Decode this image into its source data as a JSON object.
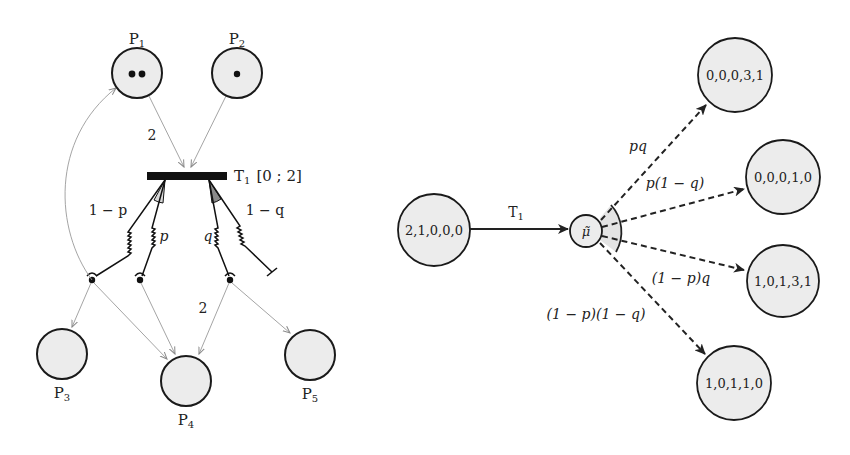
{
  "left_net": {
    "places": [
      {
        "id": "P1",
        "label": "P",
        "sub": "1",
        "cx": 137,
        "cy": 73,
        "r": 25,
        "tokens": 2,
        "label_x": 137,
        "label_y": 40
      },
      {
        "id": "P2",
        "label": "P",
        "sub": "2",
        "cx": 237,
        "cy": 73,
        "r": 25,
        "tokens": 1,
        "label_x": 237,
        "label_y": 40
      },
      {
        "id": "P3",
        "label": "P",
        "sub": "3",
        "cx": 62,
        "cy": 354,
        "r": 25,
        "tokens": 0,
        "label_x": 62,
        "label_y": 398
      },
      {
        "id": "P4",
        "label": "P",
        "sub": "4",
        "cx": 186,
        "cy": 381,
        "r": 25,
        "tokens": 0,
        "label_x": 186,
        "label_y": 425
      },
      {
        "id": "P5",
        "label": "P",
        "sub": "5",
        "cx": 310,
        "cy": 355,
        "r": 25,
        "tokens": 0,
        "label_x": 310,
        "label_y": 399
      }
    ],
    "transition": {
      "label": "T",
      "sub": "1",
      "interval": "[0 ; 2]",
      "x": 147,
      "y": 172,
      "w": 80,
      "h": 8
    },
    "input_weight": "2",
    "output_weight": "2",
    "branches": [
      {
        "label": "1 − p",
        "kind": "fork-left-outer"
      },
      {
        "label": "p",
        "kind": "fork-left-inner"
      },
      {
        "label": "q",
        "kind": "fork-right-inner"
      },
      {
        "label": "1 − q",
        "kind": "fork-right-outer"
      }
    ]
  },
  "right_graph": {
    "start": {
      "label": "2,1,0,0,0",
      "cx": 434,
      "cy": 230,
      "r": 36
    },
    "transition_label": "T",
    "transition_sub": "1",
    "intermediate": {
      "label": "μ̃",
      "cx": 586,
      "cy": 231,
      "r": 16
    },
    "targets": [
      {
        "label": "0,0,0,3,1",
        "cx": 735,
        "cy": 75,
        "r": 37,
        "prob": "pq"
      },
      {
        "label": "0,0,0,1,0",
        "cx": 783,
        "cy": 177,
        "r": 37,
        "prob": "p(1 − q)"
      },
      {
        "label": "1,0,1,3,1",
        "cx": 783,
        "cy": 281,
        "r": 36,
        "prob": "(1 − p)q"
      },
      {
        "label": "1,0,1,1,0",
        "cx": 734,
        "cy": 383,
        "r": 37,
        "prob": "(1 − p)(1 − q)"
      }
    ]
  },
  "colors": {
    "place_fill": "#ececec",
    "wedge_light": "#d8d8d8",
    "wedge_dark": "#8a8a8a",
    "ink": "#111111",
    "arc_gray": "#9a9a9a"
  }
}
